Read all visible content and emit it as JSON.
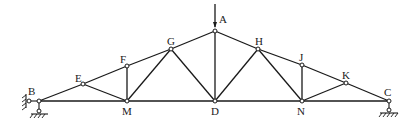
{
  "diagram": {
    "type": "roof-truss",
    "nodes": {
      "A": {
        "label": "A",
        "x": 215,
        "y": 31
      },
      "B": {
        "label": "B",
        "x": 39,
        "y": 101
      },
      "C": {
        "label": "C",
        "x": 389,
        "y": 101
      },
      "D": {
        "label": "D",
        "x": 215,
        "y": 101
      },
      "E": {
        "label": "E",
        "x": 83,
        "y": 84
      },
      "F": {
        "label": "F",
        "x": 127,
        "y": 66
      },
      "G": {
        "label": "G",
        "x": 171,
        "y": 49
      },
      "H": {
        "label": "H",
        "x": 258,
        "y": 49
      },
      "J": {
        "label": "J",
        "x": 302,
        "y": 65
      },
      "K": {
        "label": "K",
        "x": 346,
        "y": 83
      },
      "M": {
        "label": "M",
        "x": 127,
        "y": 101
      },
      "N": {
        "label": "N",
        "x": 302,
        "y": 101
      }
    },
    "members": [
      [
        "B",
        "E"
      ],
      [
        "E",
        "F"
      ],
      [
        "F",
        "G"
      ],
      [
        "G",
        "A"
      ],
      [
        "A",
        "H"
      ],
      [
        "H",
        "J"
      ],
      [
        "J",
        "K"
      ],
      [
        "K",
        "C"
      ],
      [
        "B",
        "M"
      ],
      [
        "M",
        "D"
      ],
      [
        "D",
        "N"
      ],
      [
        "N",
        "C"
      ],
      [
        "E",
        "M"
      ],
      [
        "F",
        "M"
      ],
      [
        "G",
        "M"
      ],
      [
        "G",
        "D"
      ],
      [
        "A",
        "D"
      ],
      [
        "H",
        "D"
      ],
      [
        "H",
        "N"
      ],
      [
        "J",
        "N"
      ],
      [
        "K",
        "N"
      ]
    ],
    "load": {
      "at": "A",
      "direction": "down"
    },
    "supports": {
      "B": "pin (horizontal + vertical restraint)",
      "C": "roller"
    }
  }
}
